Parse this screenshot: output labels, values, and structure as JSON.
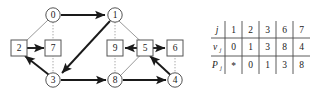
{
  "figure": {
    "graph": {
      "nodes": [
        {
          "id": "0",
          "label": "0",
          "shape": "circle",
          "cx": 53,
          "cy": 15
        },
        {
          "id": "1",
          "label": "1",
          "shape": "circle",
          "cx": 115,
          "cy": 15
        },
        {
          "id": "2",
          "label": "2",
          "shape": "square",
          "cx": 19,
          "cy": 48
        },
        {
          "id": "7",
          "label": "7",
          "shape": "square",
          "cx": 53,
          "cy": 48
        },
        {
          "id": "9",
          "label": "9",
          "shape": "square",
          "cx": 115,
          "cy": 48
        },
        {
          "id": "5",
          "label": "5",
          "shape": "square",
          "cx": 145,
          "cy": 48
        },
        {
          "id": "6",
          "label": "6",
          "shape": "square",
          "cx": 175,
          "cy": 48
        },
        {
          "id": "3",
          "label": "3",
          "shape": "circle",
          "cx": 53,
          "cy": 80
        },
        {
          "id": "8",
          "label": "8",
          "shape": "circle",
          "cx": 115,
          "cy": 80
        },
        {
          "id": "4",
          "label": "4",
          "shape": "circle",
          "cx": 175,
          "cy": 80
        }
      ],
      "bold_arrows": [
        {
          "from": "0",
          "to": "1"
        },
        {
          "from": "1",
          "to": "3"
        },
        {
          "from": "2",
          "to": "7"
        },
        {
          "from": "3",
          "to": "2"
        },
        {
          "from": "3",
          "to": "8"
        },
        {
          "from": "5",
          "to": "9"
        },
        {
          "from": "5",
          "to": "6"
        },
        {
          "from": "8",
          "to": "4"
        },
        {
          "from": "4",
          "to": "5"
        }
      ],
      "thin_edges": [
        {
          "from": "0",
          "to": "2"
        },
        {
          "from": "1",
          "to": "5"
        },
        {
          "from": "8",
          "to": "5"
        }
      ],
      "dotted_edges": [
        {
          "from": "0",
          "to": "7"
        },
        {
          "from": "1",
          "to": "9"
        },
        {
          "from": "7",
          "to": "3"
        },
        {
          "from": "9",
          "to": "8"
        },
        {
          "from": "6",
          "to": "4"
        }
      ]
    },
    "table": {
      "row_labels": [
        "j",
        "v",
        "P"
      ],
      "row_label_subscripts": [
        "",
        "j",
        "j"
      ],
      "columns": [
        "1",
        "2",
        "3",
        "6",
        "7"
      ],
      "rows": [
        {
          "label": "v",
          "sub": "j",
          "values": [
            "0",
            "1",
            "3",
            "8",
            "4"
          ]
        },
        {
          "label": "P",
          "sub": "j",
          "values": [
            "*",
            "0",
            "1",
            "3",
            "8"
          ]
        }
      ]
    },
    "colors": {
      "bold_stroke": "#1a1a1a",
      "thin_stroke": "#9a9a9a",
      "dotted_stroke": "#a8a8a8",
      "node_stroke": "#555555",
      "table_rule": "#4a4a4a",
      "text": "#1a1a1a",
      "background": "#ffffff"
    }
  }
}
